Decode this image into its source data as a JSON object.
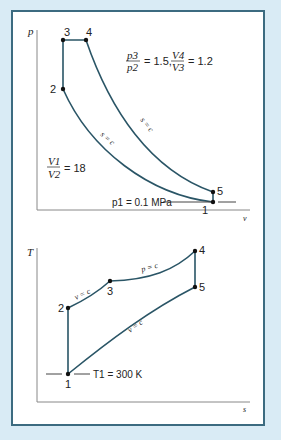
{
  "pv_diagram": {
    "y_axis": "p",
    "x_axis": "v",
    "points": [
      "1",
      "2",
      "3",
      "4",
      "5"
    ],
    "ratio_p": {
      "num": "p3",
      "den": "p2",
      "value": "= 1.5,"
    },
    "ratio_v": {
      "num": "V4",
      "den": "V3",
      "value": "= 1.2"
    },
    "compression_ratio": {
      "num": "V1",
      "den": "V2",
      "value": "= 18"
    },
    "isentrope_label": "s = c",
    "p1_label": "p1 = 0.1 MPa"
  },
  "ts_diagram": {
    "y_axis": "T",
    "x_axis": "s",
    "points": [
      "1",
      "2",
      "3",
      "4",
      "5"
    ],
    "v_label": "v = c",
    "p_label": "p = c",
    "t1_label": "T1 = 300 K"
  },
  "colors": {
    "background": "#d9ebf5",
    "border": "#3c6b80",
    "curve": "#2a5566"
  }
}
